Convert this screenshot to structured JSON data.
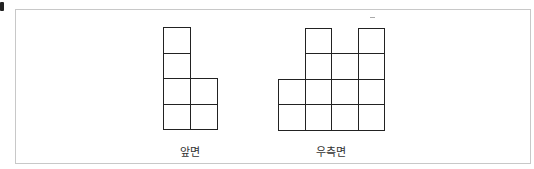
{
  "figure": {
    "views": [
      {
        "name": "front",
        "label": "앞면",
        "origin": [
          163,
          27
        ],
        "cell_w": 27,
        "cell_h": 25.5,
        "cells": [
          [
            0,
            0
          ],
          [
            0,
            1
          ],
          [
            0,
            2
          ],
          [
            1,
            2
          ],
          [
            0,
            3
          ],
          [
            1,
            3
          ]
        ]
      },
      {
        "name": "right",
        "label": "우측면",
        "origin": [
          278,
          28
        ],
        "cell_w": 26.5,
        "cell_h": 25.3,
        "cells": [
          [
            1,
            0
          ],
          [
            3,
            0
          ],
          [
            1,
            1
          ],
          [
            2,
            1
          ],
          [
            3,
            1
          ],
          [
            0,
            2
          ],
          [
            1,
            2
          ],
          [
            2,
            2
          ],
          [
            3,
            2
          ],
          [
            0,
            3
          ],
          [
            1,
            3
          ],
          [
            2,
            3
          ],
          [
            3,
            3
          ]
        ]
      }
    ],
    "colors": {
      "line": "#222222",
      "frame": "#c8c8c8"
    }
  },
  "labels": {
    "front": "앞면",
    "right": "우측면"
  }
}
